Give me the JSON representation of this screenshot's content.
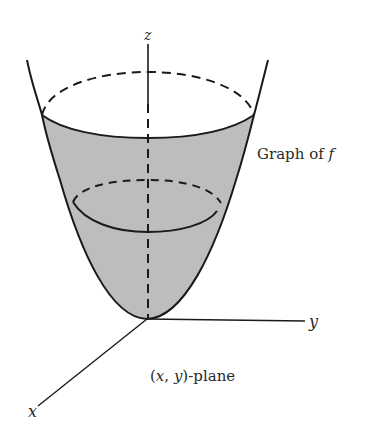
{
  "figure": {
    "labels": {
      "z_axis": "z",
      "y_axis": "y",
      "x_axis": "x",
      "graph": "Graph of ",
      "graph_f": "f",
      "plane": "-plane",
      "plane_x": "x",
      "plane_y": "y",
      "plane_open": "(",
      "plane_comma": ", ",
      "plane_close": ")"
    },
    "colors": {
      "fill": "#bdbdbd",
      "stroke": "#1a1a1a",
      "background": "#ffffff"
    }
  }
}
